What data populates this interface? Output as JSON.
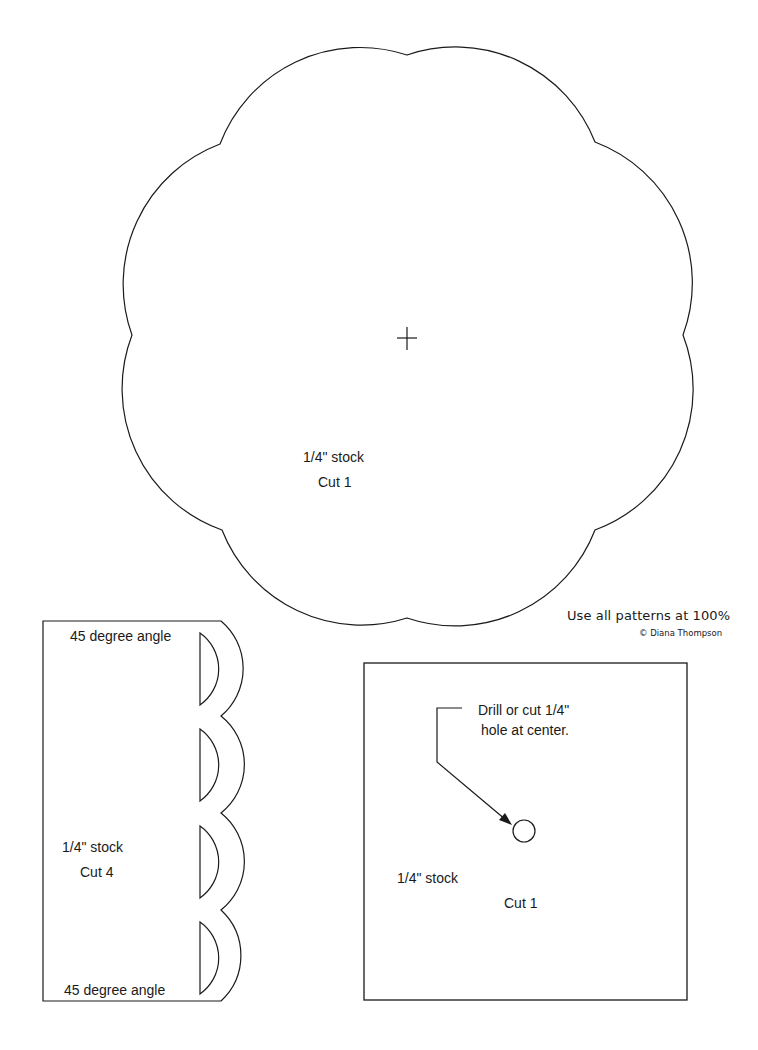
{
  "page": {
    "background": "#ffffff",
    "line_color": "#1a1a1a"
  },
  "flower_piece": {
    "shape": "eight-lobed scalloped circle",
    "center_mark": "crosshair",
    "stock_label": "1/4\" stock",
    "cut_label": "Cut 1"
  },
  "side_piece": {
    "shape": "rectangle with scalloped right edge and four half-disc cutouts",
    "top_angle_label": "45 degree angle",
    "bottom_angle_label": "45 degree angle",
    "stock_label": "1/4\" stock",
    "cut_label": "Cut 4",
    "cutout_count": 4
  },
  "square_piece": {
    "shape": "square",
    "instruction_line1": "Drill or cut 1/4\"",
    "instruction_line2": "hole at center.",
    "stock_label": "1/4\" stock",
    "cut_label": "Cut 1"
  },
  "notes": {
    "scale_note": "Use all patterns at 100%",
    "copyright": "© Diana Thompson"
  }
}
